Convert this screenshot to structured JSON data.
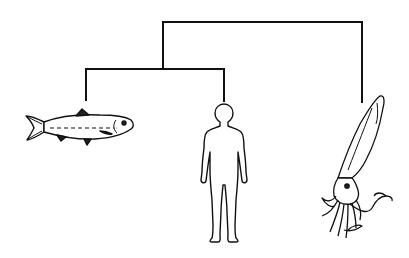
{
  "diagram": {
    "type": "cladogram",
    "line_color": "#111111",
    "background": "#ffffff",
    "taxa": [
      {
        "id": "fish",
        "name": "fish"
      },
      {
        "id": "human",
        "name": "human"
      },
      {
        "id": "squid",
        "name": "squid"
      }
    ],
    "tree": {
      "root": {
        "children": [
          "fish_human_clade",
          "squid"
        ]
      },
      "fish_human_clade": {
        "children": [
          "fish",
          "human"
        ]
      }
    }
  }
}
